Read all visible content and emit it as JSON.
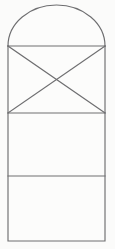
{
  "document": {
    "title": "Arched panel line drawing",
    "background_color": "#fbfbfa",
    "width": 115,
    "height": 249
  },
  "drawing": {
    "name": "arched-rectangular-panel",
    "description": "Line drawing of a vertical rectangle capped by a semi-elliptical arch, subdivided by two horizontal lines, with an X of crossed diagonals filling the upper compartment.",
    "stroke_color": "#6e6e70",
    "fill_color": "#fcfcfb",
    "stroke_width": 1.15,
    "geometry": {
      "left_x": 8,
      "right_x": 105,
      "arch_apex_y": 5,
      "arch_spring_y": 46,
      "divider_1_y": 113,
      "divider_2_y": 176,
      "bottom_y": 241
    },
    "parts": [
      {
        "id": "arch-cap",
        "label": "Semi-elliptical arch cap",
        "type": "arc",
        "cx": 56.5,
        "rx": 48.5,
        "ry": 41,
        "top_y": 5,
        "base_y": 46
      },
      {
        "id": "panel-upper-x",
        "label": "Upper compartment with crossed diagonals",
        "type": "rect",
        "x": 8,
        "y": 46,
        "width": 97,
        "height": 67
      },
      {
        "id": "diagonal-nw-se",
        "label": "Diagonal from top-left to bottom-right",
        "type": "line",
        "x1": 8,
        "y1": 46,
        "x2": 105,
        "y2": 113
      },
      {
        "id": "diagonal-sw-ne",
        "label": "Diagonal from bottom-left to top-right",
        "type": "line",
        "x1": 8,
        "y1": 113,
        "x2": 105,
        "y2": 46
      },
      {
        "id": "panel-middle",
        "label": "Middle blank compartment",
        "type": "rect",
        "x": 8,
        "y": 113,
        "width": 97,
        "height": 63
      },
      {
        "id": "panel-lower",
        "label": "Lower blank compartment",
        "type": "rect",
        "x": 8,
        "y": 176,
        "width": 97,
        "height": 65
      }
    ]
  }
}
